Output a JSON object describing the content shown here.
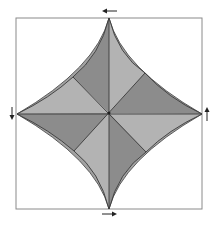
{
  "diagram": {
    "type": "origami-crease-pattern",
    "frame": {
      "x": 16,
      "y": 18,
      "width": 186,
      "height": 191,
      "stroke": "#8a8a8a"
    },
    "center": {
      "x": 109,
      "y": 113
    },
    "tips": {
      "top": {
        "x": 109,
        "y": 18
      },
      "right": {
        "x": 202,
        "y": 114
      },
      "bottom": {
        "x": 109,
        "y": 209
      },
      "left": {
        "x": 17,
        "y": 114
      }
    },
    "hinges": {
      "top_left": {
        "x": 73,
        "y": 77
      },
      "top_right": {
        "x": 145,
        "y": 73
      },
      "bottom_left": {
        "x": 74,
        "y": 151
      },
      "bottom_right": {
        "x": 146,
        "y": 152
      }
    },
    "colors": {
      "dark": "#8c8c8c",
      "light": "#b3b3b3",
      "rim": "#a2a2a2",
      "line": "#3a3a3a",
      "arrow": "#222222"
    },
    "arrows": [
      {
        "position": "top",
        "direction": "left",
        "glyph": "←"
      },
      {
        "position": "right",
        "direction": "up",
        "glyph": "↑"
      },
      {
        "position": "bottom",
        "direction": "right",
        "glyph": "→"
      },
      {
        "position": "left",
        "direction": "down",
        "glyph": "↓"
      }
    ]
  }
}
